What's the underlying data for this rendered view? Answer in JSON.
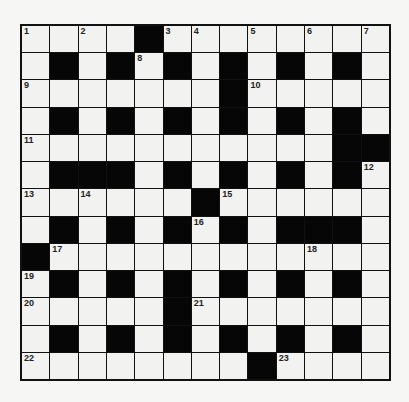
{
  "puzzle": {
    "rows": 13,
    "cols": 13,
    "grid": [
      "....#........",
      ".#.#.#.#.#.#.",
      ".......#.....",
      ".#.#.#.#.#.#.",
      "...........##",
      ".###.#.#.#.#.",
      "......#......",
      ".#.#.#.#.###.",
      "#............",
      ".#.#.#.#.#.#.",
      ".....#.......",
      ".#.#.#.#.#.#.",
      "........#...."
    ],
    "numbers": [
      {
        "r": 0,
        "c": 0,
        "n": "1"
      },
      {
        "r": 0,
        "c": 2,
        "n": "2"
      },
      {
        "r": 0,
        "c": 5,
        "n": "3"
      },
      {
        "r": 0,
        "c": 6,
        "n": "4"
      },
      {
        "r": 0,
        "c": 8,
        "n": "5"
      },
      {
        "r": 0,
        "c": 10,
        "n": "6"
      },
      {
        "r": 0,
        "c": 12,
        "n": "7"
      },
      {
        "r": 1,
        "c": 4,
        "n": "8"
      },
      {
        "r": 2,
        "c": 0,
        "n": "9"
      },
      {
        "r": 2,
        "c": 8,
        "n": "10"
      },
      {
        "r": 4,
        "c": 0,
        "n": "11"
      },
      {
        "r": 5,
        "c": 12,
        "n": "12"
      },
      {
        "r": 6,
        "c": 0,
        "n": "13"
      },
      {
        "r": 6,
        "c": 2,
        "n": "14"
      },
      {
        "r": 6,
        "c": 7,
        "n": "15"
      },
      {
        "r": 7,
        "c": 6,
        "n": "16"
      },
      {
        "r": 8,
        "c": 1,
        "n": "17"
      },
      {
        "r": 8,
        "c": 10,
        "n": "18"
      },
      {
        "r": 9,
        "c": 0,
        "n": "19"
      },
      {
        "r": 10,
        "c": 0,
        "n": "20"
      },
      {
        "r": 10,
        "c": 6,
        "n": "21"
      },
      {
        "r": 12,
        "c": 0,
        "n": "22"
      },
      {
        "r": 12,
        "c": 9,
        "n": "23"
      }
    ]
  },
  "colors": {
    "block": "#060606",
    "cell": "#f2f2f0",
    "border": "#111111",
    "background": "#f6f6f4"
  }
}
